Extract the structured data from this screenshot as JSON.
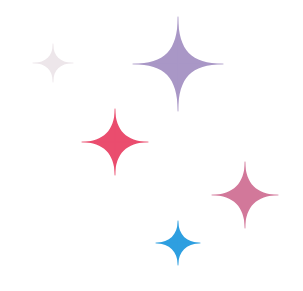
{
  "canvas": {
    "width": 303,
    "height": 291,
    "background": "#ffffff"
  },
  "sparkles": [
    {
      "name": "sparkle-grey",
      "cx": 53,
      "cy": 63,
      "rx": 20,
      "ry": 19,
      "waist": 4,
      "color": "#ede6ea"
    },
    {
      "name": "sparkle-purple",
      "cx": 178,
      "cy": 64,
      "rx": 45,
      "ry": 47,
      "waist": 8,
      "color": "#a997c6"
    },
    {
      "name": "sparkle-red",
      "cx": 115,
      "cy": 142,
      "rx": 33,
      "ry": 33,
      "waist": 7,
      "color": "#ea4d6e"
    },
    {
      "name": "sparkle-pink",
      "cx": 245,
      "cy": 195,
      "rx": 33,
      "ry": 33,
      "waist": 7,
      "color": "#d2789a"
    },
    {
      "name": "sparkle-blue",
      "cx": 178,
      "cy": 243,
      "rx": 22,
      "ry": 22,
      "waist": 5,
      "color": "#2e9fe0"
    }
  ]
}
